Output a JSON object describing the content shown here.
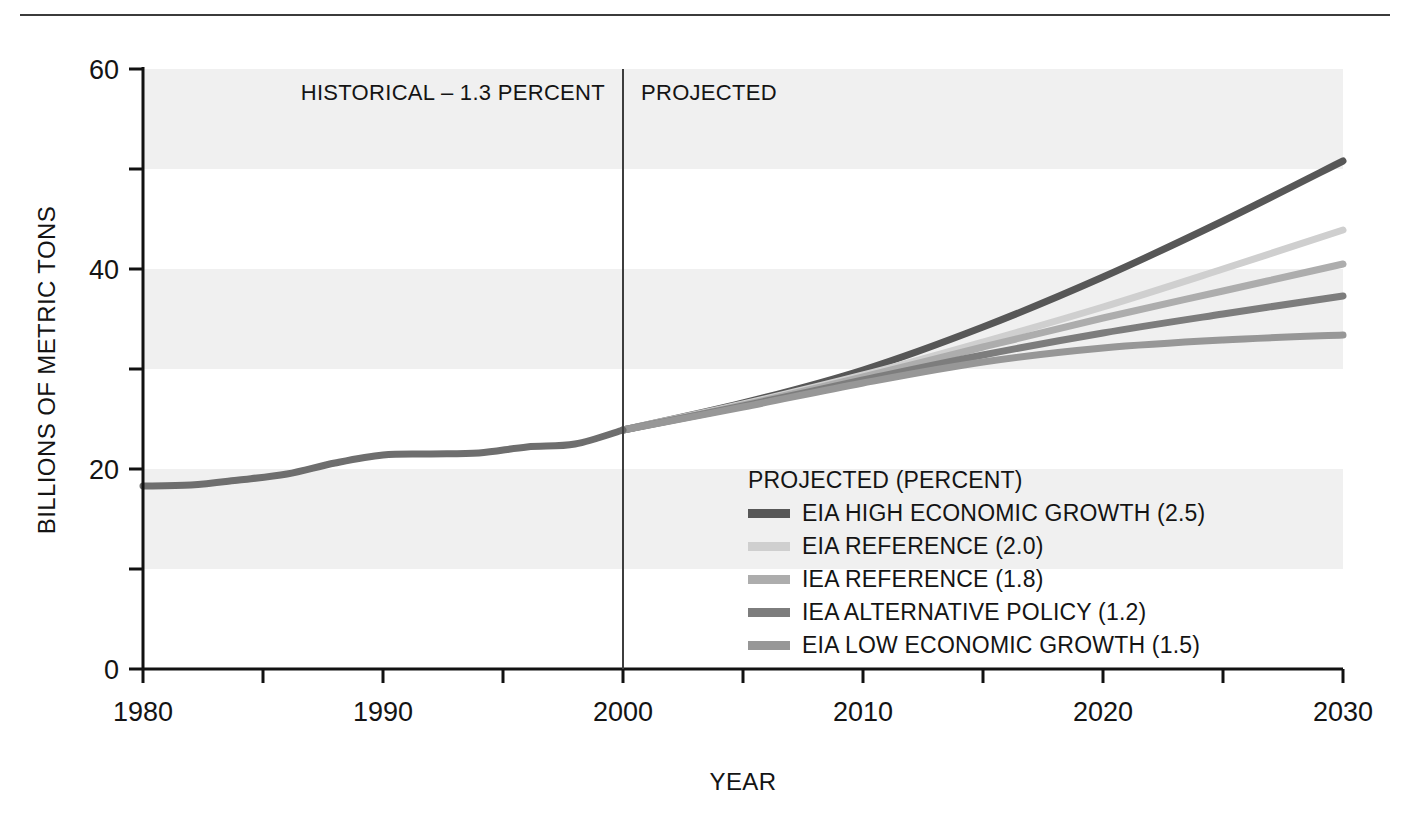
{
  "chart_data": {
    "type": "line",
    "title": "",
    "xlabel": "YEAR",
    "ylabel": "BILLIONS OF METRIC TONS",
    "xlim": [
      1980,
      2030
    ],
    "ylim": [
      0,
      60
    ],
    "x_ticks_major": [
      1980,
      1990,
      2000,
      2010,
      2020,
      2030
    ],
    "x_ticks_minor": [
      1985,
      1995,
      2005,
      2015,
      2025
    ],
    "y_ticks_major": [
      0,
      20,
      40,
      60
    ],
    "y_ticks_minor": [
      10,
      30,
      50
    ],
    "grid": "alternating horizontal bands every 10 units",
    "legend_position": "inside lower-right of plot area",
    "annotations": [
      {
        "text": "HISTORICAL – 1.3 PERCENT",
        "x": 1993,
        "y": 57
      },
      {
        "text": "PROJECTED",
        "x": 2002,
        "y": 57
      }
    ],
    "divider_x": 2000,
    "series": [
      {
        "name": "HISTORICAL",
        "color": "#6e6e6e",
        "historical": true,
        "x": [
          1980,
          1982,
          1984,
          1986,
          1988,
          1990,
          1992,
          1994,
          1996,
          1998,
          2000
        ],
        "values": [
          18.3,
          18.4,
          18.9,
          19.5,
          20.6,
          21.4,
          21.5,
          21.6,
          22.2,
          22.5,
          23.9
        ]
      },
      {
        "name": "EIA HIGH ECONOMIC GROWTH (2.5)",
        "color": "#575757",
        "historical": false,
        "x": [
          2000,
          2005,
          2010,
          2015,
          2020,
          2025,
          2030
        ],
        "values": [
          23.9,
          26.6,
          29.9,
          34.2,
          39.2,
          44.8,
          50.8
        ]
      },
      {
        "name": "EIA REFERENCE (2.0)",
        "color": "#cfcfcf",
        "historical": false,
        "x": [
          2000,
          2005,
          2010,
          2015,
          2020,
          2025,
          2030
        ],
        "values": [
          23.9,
          26.5,
          29.4,
          32.7,
          36.2,
          40.0,
          43.9
        ]
      },
      {
        "name": "IEA REFERENCE (1.8)",
        "color": "#adadad",
        "historical": false,
        "x": [
          2000,
          2005,
          2010,
          2015,
          2020,
          2025,
          2030
        ],
        "values": [
          23.9,
          26.4,
          29.2,
          32.2,
          35.1,
          37.8,
          40.5
        ]
      },
      {
        "name": "IEA ALTERNATIVE POLICY (1.2)",
        "color": "#7d7d7d",
        "historical": false,
        "x": [
          2000,
          2005,
          2010,
          2015,
          2020,
          2025,
          2030
        ],
        "values": [
          23.9,
          26.3,
          28.9,
          31.4,
          33.6,
          35.5,
          37.3
        ]
      },
      {
        "name": "EIA LOW ECONOMIC GROWTH (1.5)",
        "color": "#979797",
        "historical": false,
        "x": [
          2000,
          2005,
          2010,
          2015,
          2020,
          2025,
          2030
        ],
        "values": [
          23.9,
          26.2,
          28.6,
          30.7,
          32.1,
          32.9,
          33.4
        ]
      }
    ],
    "legend": {
      "title": "PROJECTED (PERCENT)",
      "entries": [
        {
          "label": "EIA HIGH ECONOMIC GROWTH (2.5)",
          "color": "#575757"
        },
        {
          "label": "EIA REFERENCE (2.0)",
          "color": "#cfcfcf"
        },
        {
          "label": "IEA REFERENCE (1.8)",
          "color": "#adadad"
        },
        {
          "label": "IEA ALTERNATIVE POLICY (1.2)",
          "color": "#7d7d7d"
        },
        {
          "label": "EIA LOW ECONOMIC GROWTH (1.5)",
          "color": "#979797"
        }
      ]
    }
  },
  "axes": {
    "y_labels": [
      "60",
      "40",
      "20",
      "0"
    ],
    "x_labels": [
      "1980",
      "1990",
      "2000",
      "2010",
      "2020",
      "2030"
    ],
    "y_title": "BILLIONS OF METRIC TONS",
    "x_title": "YEAR"
  },
  "periods": {
    "historical": "HISTORICAL – 1.3 PERCENT",
    "projected": "PROJECTED"
  },
  "colors": {
    "band": "#f0f0f0",
    "axis": "#111111",
    "divider": "#3d3d3d",
    "rule": "#3b3b3b"
  }
}
